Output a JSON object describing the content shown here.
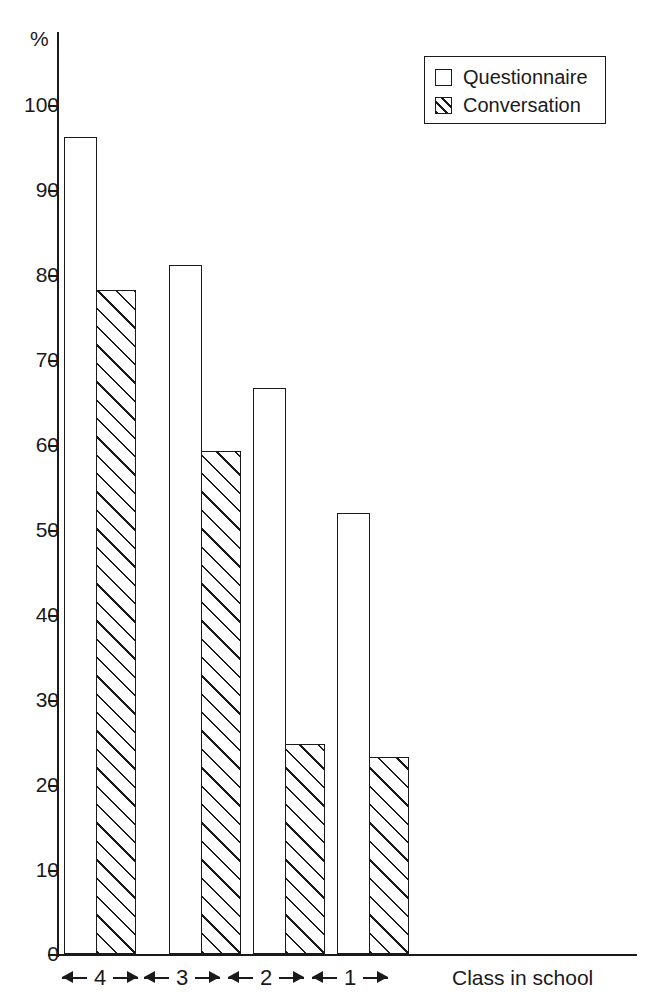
{
  "chart_data": {
    "type": "bar",
    "title": "",
    "xlabel": "Class in school",
    "ylabel": "%",
    "ylim": [
      0,
      100
    ],
    "grid": false,
    "legend_position": "top-right",
    "categories": [
      "4",
      "3",
      "2",
      "1"
    ],
    "ytick_labels": [
      "100",
      "90",
      "80",
      "70",
      "60",
      "50",
      "40",
      "30",
      "20",
      "10",
      "0"
    ],
    "ytick_values": [
      100,
      90,
      80,
      70,
      60,
      50,
      40,
      30,
      20,
      10,
      0
    ],
    "series": [
      {
        "name": "Questionnaire",
        "pattern": "empty",
        "values": [
          96.2,
          81.1,
          66.7,
          51.9
        ]
      },
      {
        "name": "Conversation",
        "pattern": "hatched",
        "values": [
          78.2,
          59.2,
          24.7,
          23.2
        ]
      }
    ]
  },
  "axes": {
    "y_unit_label": "%",
    "x_axis_title": "Class in school"
  },
  "legend": {
    "entries": [
      {
        "label": "Questionnaire",
        "swatch": "empty-square-icon"
      },
      {
        "label": "Conversation",
        "swatch": "hatched-square-icon"
      }
    ]
  }
}
